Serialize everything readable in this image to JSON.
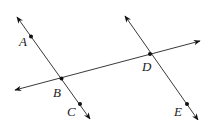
{
  "diagram": {
    "lines": [
      {
        "name": "line-ABC",
        "through": [
          "A",
          "B",
          "C"
        ],
        "arrows": "both"
      },
      {
        "name": "line-BD",
        "through": [
          "B",
          "D"
        ],
        "arrows": "both"
      },
      {
        "name": "line-DE",
        "through": [
          "D",
          "E"
        ],
        "arrows": "both"
      }
    ],
    "points": [
      {
        "label": "A",
        "on": [
          "line-ABC"
        ]
      },
      {
        "label": "B",
        "on": [
          "line-ABC",
          "line-BD"
        ]
      },
      {
        "label": "C",
        "on": [
          "line-ABC"
        ]
      },
      {
        "label": "D",
        "on": [
          "line-BD",
          "line-DE"
        ]
      },
      {
        "label": "E",
        "on": [
          "line-DE"
        ]
      }
    ],
    "colors": {
      "line": "#3a3a3a",
      "point": "#111111",
      "label": "#222222",
      "background": "#ffffff"
    }
  }
}
